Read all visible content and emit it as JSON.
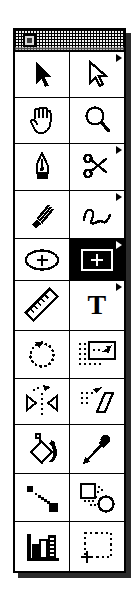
{
  "window": {
    "title": "",
    "kind": "floating-tool-palette",
    "close_box_label": "close",
    "columns": 2,
    "rows": 11,
    "colors": {
      "background": "#ffffff",
      "ink": "#000000",
      "shadow": "#2b2b2b",
      "title_bar_fill": "#f2f2f2",
      "selected_fill": "#000000",
      "selected_ink": "#ffffff"
    }
  },
  "tools": [
    {
      "id": "selection",
      "label": "Selection",
      "icon": "solid-arrow-icon",
      "selected": false,
      "has_popup": false
    },
    {
      "id": "direct-selection",
      "label": "Direct Selection",
      "icon": "hollow-arrow-icon",
      "selected": false,
      "has_popup": true
    },
    {
      "id": "hand",
      "label": "Hand",
      "icon": "hand-icon",
      "selected": false,
      "has_popup": false
    },
    {
      "id": "zoom",
      "label": "Zoom",
      "icon": "magnifier-icon",
      "selected": false,
      "has_popup": false
    },
    {
      "id": "pen",
      "label": "Pen",
      "icon": "pen-nib-icon",
      "selected": false,
      "has_popup": false
    },
    {
      "id": "scissors",
      "label": "Scissors",
      "icon": "scissors-icon",
      "selected": false,
      "has_popup": true
    },
    {
      "id": "paintbrush",
      "label": "Paintbrush",
      "icon": "paintbrush-icon",
      "selected": false,
      "has_popup": false
    },
    {
      "id": "freehand",
      "label": "Freehand",
      "icon": "squiggle-line-icon",
      "selected": false,
      "has_popup": true
    },
    {
      "id": "ellipse",
      "label": "Ellipse",
      "icon": "ellipse-plus-icon",
      "selected": false,
      "has_popup": false
    },
    {
      "id": "rectangle",
      "label": "Rectangle",
      "icon": "rectangle-plus-icon",
      "selected": true,
      "has_popup": true
    },
    {
      "id": "measure",
      "label": "Measure",
      "icon": "ruler-icon",
      "selected": false,
      "has_popup": false
    },
    {
      "id": "type",
      "label": "Type",
      "icon": "text-t-icon",
      "selected": false,
      "has_popup": true
    },
    {
      "id": "rotate",
      "label": "Rotate",
      "icon": "rotate-dotted-circle-icon",
      "selected": false,
      "has_popup": false
    },
    {
      "id": "scale",
      "label": "Scale",
      "icon": "scale-box-arrow-icon",
      "selected": false,
      "has_popup": false
    },
    {
      "id": "reflect",
      "label": "Reflect",
      "icon": "reflect-triangles-icon",
      "selected": false,
      "has_popup": false
    },
    {
      "id": "shear",
      "label": "Shear",
      "icon": "shear-parallelogram-icon",
      "selected": false,
      "has_popup": false
    },
    {
      "id": "paint-bucket",
      "label": "Paint Bucket",
      "icon": "paint-bucket-icon",
      "selected": false,
      "has_popup": false
    },
    {
      "id": "eyedropper",
      "label": "Eyedropper",
      "icon": "eyedropper-icon",
      "selected": false,
      "has_popup": false
    },
    {
      "id": "blend",
      "label": "Blend",
      "icon": "blend-diagonal-icon",
      "selected": false,
      "has_popup": false
    },
    {
      "id": "blend-shapes",
      "label": "Blend Shapes",
      "icon": "square-to-circle-icon",
      "selected": false,
      "has_popup": false
    },
    {
      "id": "graph",
      "label": "Graph",
      "icon": "bar-chart-icon",
      "selected": false,
      "has_popup": false
    },
    {
      "id": "page",
      "label": "Page",
      "icon": "crop-page-icon",
      "selected": false,
      "has_popup": false
    }
  ],
  "type_tool_glyph": "T"
}
